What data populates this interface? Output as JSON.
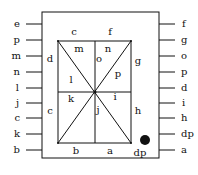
{
  "diagram": {
    "left_pins": [
      "e",
      "p",
      "m",
      "n",
      "l",
      "j",
      "c",
      "k",
      "b"
    ],
    "right_pins": [
      "f",
      "g",
      "o",
      "p",
      "d",
      "i",
      "h",
      "dp",
      "a"
    ],
    "segments": {
      "top_left": "c",
      "top_right": "f",
      "left_upper": "d",
      "left_lower": "c",
      "right_upper": "g",
      "right_lower": "h",
      "bottom_left": "b",
      "bottom_right": "a",
      "diag_upper_left": "m",
      "vert_upper_right_label": "n",
      "vert_upper": "o",
      "diag_upper_right": "p",
      "horiz_left": "l",
      "diag_lower_left": "k",
      "vert_lower": "j",
      "diag_lower_right": "i"
    },
    "decimal_point": "dp",
    "colors": {
      "line": "#111111",
      "background": "#ffffff"
    }
  }
}
